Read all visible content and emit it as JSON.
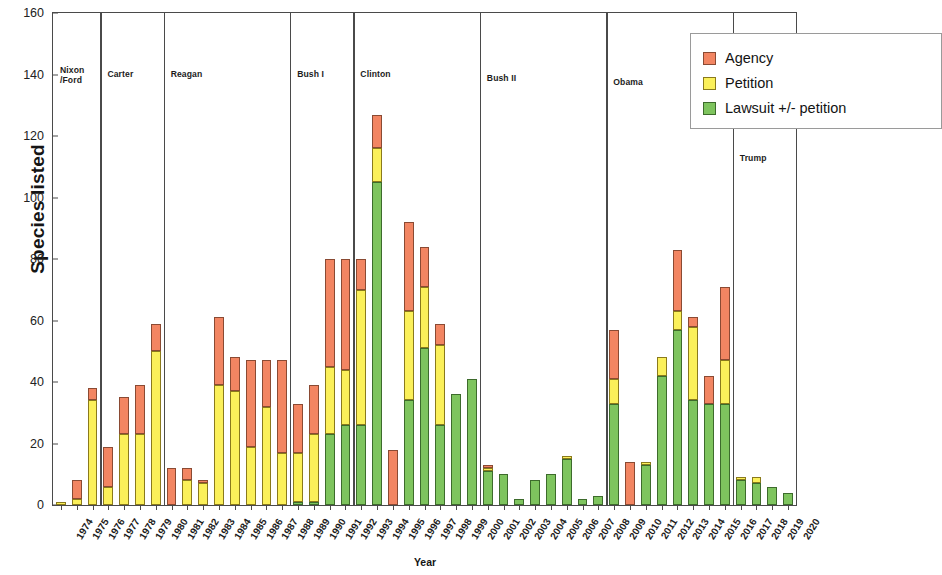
{
  "chart_data": {
    "type": "bar",
    "subtype": "stacked-vertical",
    "title": "",
    "xlabel": "Year",
    "ylabel": "Species listed",
    "ylim": [
      0,
      160
    ],
    "ytick_step": 20,
    "yticks": [
      0,
      20,
      40,
      60,
      80,
      100,
      120,
      140,
      160
    ],
    "grid": false,
    "legend_position": "top-right",
    "legend": [
      "Agency",
      "Petition",
      "Lawsuit +/- petition"
    ],
    "colors": {
      "agency": "#f28562",
      "petition": "#fbf05a",
      "lawsuit": "#7ec45e",
      "axis": "#4a4a4a"
    },
    "categories": [
      "1974",
      "1975",
      "1976",
      "1977",
      "1978",
      "1979",
      "1980",
      "1981",
      "1982",
      "1983",
      "1984",
      "1985",
      "1986",
      "1987",
      "1988",
      "1989",
      "1990",
      "1991",
      "1992",
      "1993",
      "1994",
      "1995",
      "1996",
      "1997",
      "1998",
      "1999",
      "2000",
      "2001",
      "2002",
      "2003",
      "2004",
      "2005",
      "2006",
      "2007",
      "2008",
      "2009",
      "2010",
      "2011",
      "2012",
      "2013",
      "2014",
      "2015",
      "2016",
      "2017",
      "2018",
      "2019",
      "2020"
    ],
    "series": [
      {
        "name": "Lawsuit +/- petition",
        "key": "lawsuit",
        "values": [
          0,
          0,
          0,
          0,
          0,
          0,
          0,
          0,
          0,
          0,
          0,
          0,
          0,
          0,
          0,
          1,
          1,
          23,
          26,
          26,
          105,
          0,
          34,
          51,
          26,
          36,
          41,
          11,
          10,
          2,
          8,
          10,
          15,
          2,
          3,
          33,
          0,
          13,
          42,
          57,
          34,
          33,
          33,
          8,
          7,
          6,
          4
        ]
      },
      {
        "name": "Petition",
        "key": "petition",
        "values": [
          1,
          2,
          34,
          6,
          23,
          23,
          50,
          0,
          8,
          7,
          39,
          37,
          19,
          32,
          17,
          16,
          22,
          22,
          18,
          44,
          11,
          0,
          29,
          20,
          26,
          0,
          0,
          1,
          0,
          0,
          0,
          0,
          1,
          0,
          0,
          8,
          0,
          1,
          6,
          6,
          24,
          0,
          14,
          1,
          2,
          0,
          0
        ]
      },
      {
        "name": "Agency",
        "key": "agency",
        "values": [
          0,
          6,
          4,
          13,
          12,
          16,
          9,
          12,
          4,
          1,
          22,
          11,
          28,
          15,
          30,
          16,
          16,
          35,
          36,
          10,
          11,
          18,
          29,
          13,
          7,
          0,
          0,
          1,
          0,
          0,
          0,
          0,
          0,
          0,
          0,
          16,
          14,
          0,
          0,
          20,
          3,
          9,
          24,
          0,
          0,
          0,
          0
        ]
      }
    ],
    "totals": [
      1,
      8,
      38,
      19,
      35,
      39,
      59,
      12,
      12,
      8,
      61,
      48,
      47,
      47,
      47,
      33,
      39,
      80,
      80,
      80,
      127,
      18,
      92,
      84,
      59,
      36,
      41,
      13,
      10,
      2,
      8,
      10,
      16,
      2,
      3,
      57,
      14,
      14,
      48,
      83,
      61,
      42,
      71,
      9,
      9,
      6,
      4
    ],
    "administrations": [
      {
        "label": "Nixon\n/Ford",
        "start_year": 1974,
        "end_year": 1976
      },
      {
        "label": "Carter",
        "start_year": 1977,
        "end_year": 1980
      },
      {
        "label": "Reagan",
        "start_year": 1981,
        "end_year": 1988
      },
      {
        "label": "Bush I",
        "start_year": 1989,
        "end_year": 1992
      },
      {
        "label": "Clinton",
        "start_year": 1993,
        "end_year": 2000
      },
      {
        "label": "Bush II",
        "start_year": 2001,
        "end_year": 2008
      },
      {
        "label": "Obama",
        "start_year": 2009,
        "end_year": 2016
      },
      {
        "label": "Trump",
        "start_year": 2017,
        "end_year": 2020
      }
    ],
    "admin_label_top_px": {
      "Nixon\n/Ford": 52,
      "Carter": 56,
      "Reagan": 56,
      "Bush I": 56,
      "Clinton": 56,
      "Bush II": 60,
      "Obama": 64,
      "Trump": 140
    }
  },
  "axes": {
    "y_title": "Species listed",
    "x_title": "Year"
  },
  "legend": {
    "items": [
      {
        "label": "Agency",
        "key": "agency"
      },
      {
        "label": "Petition",
        "key": "petition"
      },
      {
        "label": "Lawsuit +/- petition",
        "key": "lawsuit"
      }
    ]
  }
}
